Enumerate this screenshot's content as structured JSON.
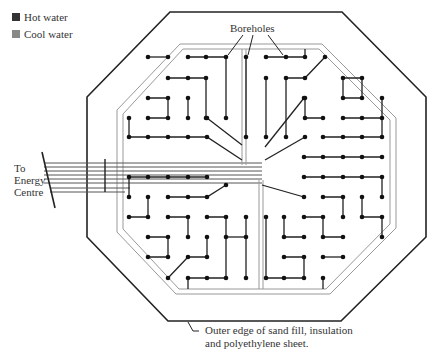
{
  "legend": {
    "items": [
      {
        "label": "Hot water",
        "color": "#333333"
      },
      {
        "label": "Cool water",
        "color": "#888888"
      }
    ]
  },
  "labels": {
    "boreholes": "Boreholes",
    "energy_centre_line1": "To",
    "energy_centre_line2": "Energy",
    "energy_centre_line3": "Centre",
    "outer_edge_line1": "Outer edge of sand fill, insulation",
    "outer_edge_line2": "and polyethylene sheet."
  },
  "colors": {
    "hot": "#222222",
    "cool": "#999999",
    "outline": "#222222"
  },
  "grid": {
    "x0": 129,
    "y0": 57,
    "step": 19.6,
    "cols": 14,
    "rows": 12
  }
}
